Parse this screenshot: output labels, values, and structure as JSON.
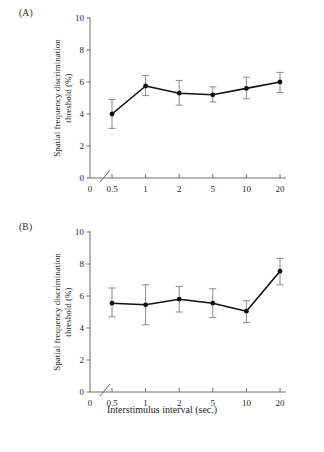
{
  "figure": {
    "xtitle": "Interstimulus interval (sec.)",
    "ylabel_line1": "Spatial frequency discrimination",
    "ylabel_line2": "threshold (%)"
  },
  "panels": [
    {
      "label": "(A)"
    },
    {
      "label": "(B)"
    }
  ],
  "axis": {
    "y_ticks": [
      "0",
      "2",
      "4",
      "6",
      "8",
      "10"
    ],
    "x_ticks": [
      "0",
      "0.5",
      "1",
      "2",
      "5",
      "10",
      "20"
    ]
  },
  "chart_data": [
    {
      "type": "line",
      "title": "(A)",
      "xlabel": "Interstimulus interval (sec.)",
      "ylabel": "Spatial frequency discrimination threshold (%)",
      "categories": [
        "0.5",
        "1",
        "2",
        "5",
        "10",
        "20"
      ],
      "values": [
        4.0,
        5.75,
        5.3,
        5.2,
        5.6,
        6.0
      ],
      "error_low": [
        3.1,
        5.15,
        4.55,
        4.75,
        4.95,
        5.35
      ],
      "error_high": [
        4.9,
        6.4,
        6.1,
        5.7,
        6.3,
        6.6
      ],
      "ylim": [
        0,
        10
      ],
      "yticks": [
        0,
        2,
        4,
        6,
        8,
        10
      ],
      "grid": false,
      "legend": "none",
      "axis_break_x": true,
      "marker": "filled-circle",
      "line_color": "#111111"
    },
    {
      "type": "line",
      "title": "(B)",
      "xlabel": "Interstimulus interval (sec.)",
      "ylabel": "Spatial frequency discrimination threshold (%)",
      "categories": [
        "0.5",
        "1",
        "2",
        "5",
        "10",
        "20"
      ],
      "values": [
        5.55,
        5.45,
        5.8,
        5.55,
        5.05,
        7.55
      ],
      "error_low": [
        4.7,
        4.2,
        5.0,
        4.65,
        4.35,
        6.7
      ],
      "error_high": [
        6.5,
        6.7,
        6.6,
        6.45,
        5.7,
        8.35
      ],
      "ylim": [
        0,
        10
      ],
      "yticks": [
        0,
        2,
        4,
        6,
        8,
        10
      ],
      "grid": false,
      "legend": "none",
      "axis_break_x": true,
      "marker": "filled-circle",
      "line_color": "#111111"
    }
  ]
}
